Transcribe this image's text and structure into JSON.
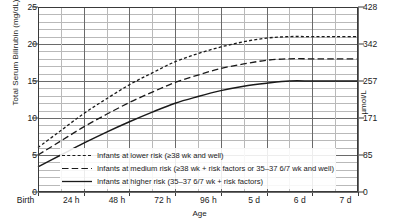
{
  "chart_data": {
    "type": "line",
    "title": "",
    "xlabel": "Age",
    "ylabel": "Total Serum Bilirubin (mg/dL)",
    "ylabel_right": "µmol/L",
    "ylim": [
      0,
      25
    ],
    "ylim_right": [
      0,
      428
    ],
    "grid": true,
    "legend_position": "bottom-left",
    "y_ticks": [
      "0",
      "5",
      "10",
      "15",
      "20",
      "25"
    ],
    "y_tick_values": [
      0,
      5,
      10,
      15,
      20,
      25
    ],
    "y_ticks_right": [
      "0",
      "85",
      "171",
      "257",
      "342",
      "428"
    ],
    "y_tick_values_right": [
      0,
      85,
      171,
      257,
      342,
      428
    ],
    "x_ticks": [
      "Birth",
      "24 h",
      "48 h",
      "72 h",
      "96 h",
      "5 d",
      "6 d",
      "7 d"
    ],
    "x_tick_hours": [
      0,
      24,
      48,
      72,
      96,
      120,
      144,
      168
    ],
    "x_minor_interval_hours": 12,
    "y_minor_interval": 1,
    "x": [
      0,
      12,
      24,
      36,
      48,
      60,
      72,
      84,
      96,
      108,
      120,
      132,
      144,
      156,
      168
    ],
    "series": [
      {
        "name": "Infants at lower risk (≥38 wk and well)",
        "style": "dotted",
        "color": "#1a1a1a",
        "values": [
          6.0,
          8.3,
          10.6,
          12.6,
          14.5,
          16.1,
          17.6,
          18.7,
          19.6,
          20.3,
          20.8,
          21.0,
          21.0,
          21.0,
          21.0
        ]
      },
      {
        "name": "Infants at medium risk (≥38 wk + risk factors or 35–37 6/7 wk and well)",
        "style": "dashed",
        "color": "#1a1a1a",
        "values": [
          5.0,
          6.9,
          8.8,
          10.5,
          12.1,
          13.5,
          14.8,
          15.8,
          16.7,
          17.3,
          17.8,
          18.0,
          18.0,
          18.0,
          18.0
        ]
      },
      {
        "name": "Infants at higher risk (35–37 6/7 wk + risk factors)",
        "style": "solid",
        "color": "#1a1a1a",
        "values": [
          3.4,
          5.0,
          6.6,
          8.1,
          9.5,
          10.8,
          12.0,
          12.9,
          13.7,
          14.3,
          14.7,
          15.0,
          15.0,
          15.0,
          15.0
        ]
      }
    ]
  },
  "axes": {
    "left_title": "Total Serum Bilirubin (mg/dL)",
    "right_title": "µmol/L",
    "bottom_title": "Age"
  },
  "legend": {
    "entries": [
      {
        "label": "Infants at lower risk (≥38 wk and well)",
        "style": "dotted"
      },
      {
        "label": "Infants at medium risk (≥38 wk + risk factors or 35–37 6/7 wk and well)",
        "style": "dashed"
      },
      {
        "label": "Infants at higher risk (35–37 6/7 wk + risk factors)",
        "style": "solid"
      }
    ]
  },
  "colors": {
    "line": "#1a1a1a",
    "grid_minor": "#b9b9b9",
    "grid_major": "#6a6a6a",
    "frame": "#3a3a3a"
  }
}
